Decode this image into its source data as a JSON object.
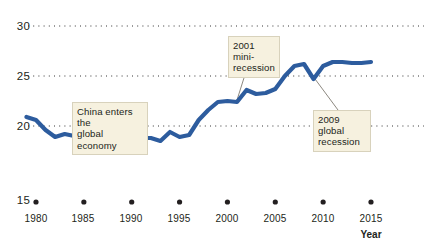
{
  "chart_data": {
    "type": "line",
    "title": "",
    "subtitle": "",
    "xlabel": "Year",
    "ylabel": "",
    "xlim": [
      1979,
      2016
    ],
    "ylim": [
      15,
      30
    ],
    "grid": "horizontal-dotted",
    "legend": "none",
    "line_color": "#2d5c9e",
    "xticks": [
      1980,
      1985,
      1990,
      1995,
      2000,
      2005,
      2010,
      2015
    ],
    "xtick_labels": [
      "1980",
      "1985",
      "1990",
      "1995",
      "2000",
      "2005",
      "2010",
      "2015"
    ],
    "yticks": [
      15,
      20,
      25,
      30
    ],
    "ytick_labels": [
      "15",
      "20",
      "25",
      "30"
    ],
    "gridline_values": [
      20,
      25,
      30
    ],
    "series": [
      {
        "name": "World trade share",
        "x": [
          1979,
          1980,
          1981,
          1982,
          1983,
          1984,
          1985,
          1986,
          1987,
          1988,
          1989,
          1990,
          1991,
          1992,
          1993,
          1994,
          1995,
          1996,
          1997,
          1998,
          1999,
          2000,
          2001,
          2002,
          2003,
          2004,
          2005,
          2006,
          2007,
          2008,
          2009,
          2010,
          2011,
          2012,
          2013,
          2014,
          2015
        ],
        "values": [
          20.9,
          20.6,
          19.6,
          18.9,
          19.2,
          19.0,
          18.9,
          17.9,
          18.3,
          18.5,
          18.6,
          19.1,
          18.8,
          18.8,
          18.5,
          19.4,
          18.9,
          19.1,
          20.6,
          21.6,
          22.4,
          22.5,
          22.4,
          23.6,
          23.2,
          23.3,
          23.7,
          25.0,
          26.0,
          26.2,
          24.7,
          26.0,
          26.4,
          26.4,
          26.3,
          26.3,
          26.4
        ]
      }
    ],
    "annotations": [
      {
        "id": "china-note",
        "text": "China enters the\nglobal economy",
        "target_year": 1986,
        "target_value": 17.9
      },
      {
        "id": "mini-recession-note",
        "text": "2001 mini-\nrecession",
        "target_year": 2001,
        "target_value": 22.4
      },
      {
        "id": "global-recession-note",
        "text": "2009 global\nrecession",
        "target_year": 2009,
        "target_value": 24.7
      }
    ]
  },
  "labels": {
    "y_30": "30",
    "y_25": "25",
    "y_20": "20",
    "y_15": "15",
    "x_1980": "1980",
    "x_1985": "1985",
    "x_1990": "1990",
    "x_1995": "1995",
    "x_2000": "2000",
    "x_2005": "2005",
    "x_2010": "2010",
    "x_2015": "2015",
    "axis_title": "Year",
    "note_china": "China enters the\nglobal economy",
    "note_2001": "2001 mini-\nrecession",
    "note_2009": "2009 global\nrecession"
  }
}
